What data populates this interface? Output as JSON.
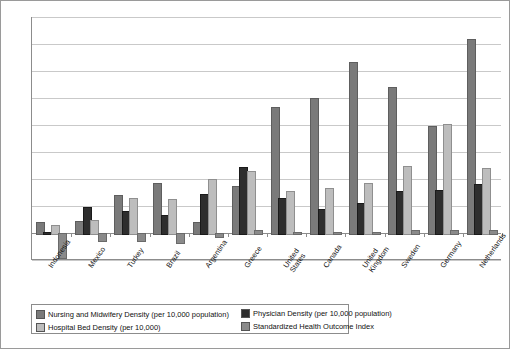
{
  "chart_data": {
    "type": "bar",
    "title": "",
    "subtitle": "",
    "xlabel": "",
    "ylabel": "",
    "ylim": [
      -20,
      160
    ],
    "ytick_step": 20,
    "yticks": [
      160,
      140,
      120,
      100,
      80,
      60,
      40,
      20,
      0,
      -20
    ],
    "grid": true,
    "legend_position": "bottom",
    "categories": [
      "Indonesia",
      "Mexico",
      "Turkey",
      "Brazil",
      "Argentina",
      "Greece",
      "United States",
      "Canada",
      "United Kingdom",
      "Sweden",
      "Germany",
      "Netherlands"
    ],
    "series": [
      {
        "name": "Nursing and Midwifery Density (per 10,000 population)",
        "color": "#7a7a7a",
        "values": [
          8,
          9,
          28,
          37,
          8,
          35,
          93,
          100,
          127,
          108,
          79,
          144
        ]
      },
      {
        "name": "Physician Density (per 10,000 population)",
        "color": "#2e2e2e",
        "values": [
          1,
          19.5,
          16,
          13,
          29,
          49,
          26,
          18,
          22,
          31,
          32,
          36
        ]
      },
      {
        "name": "Hospital Bed Density (per 10,000)",
        "color": "#bdbdbd",
        "values": [
          6,
          10,
          26,
          25,
          40,
          46,
          31,
          33,
          37,
          50,
          81,
          48
        ]
      },
      {
        "name": "Standardized Health Outcome Index",
        "color": "#8a8a8a",
        "values": [
          -18,
          -5,
          -5,
          -7,
          -2,
          2,
          1,
          1,
          1,
          2,
          2,
          2
        ]
      }
    ]
  },
  "legend": {
    "items": [
      {
        "label": "Nursing and Midwifery Density (per 10,000 population)",
        "color": "#7a7a7a"
      },
      {
        "label": "Hospital Bed Density (per 10,000)",
        "color": "#bdbdbd"
      },
      {
        "label": "Physician Density (per 10,000 population)",
        "color": "#2e2e2e"
      },
      {
        "label": "Standardized Health Outcome Index",
        "color": "#8a8a8a"
      }
    ]
  }
}
